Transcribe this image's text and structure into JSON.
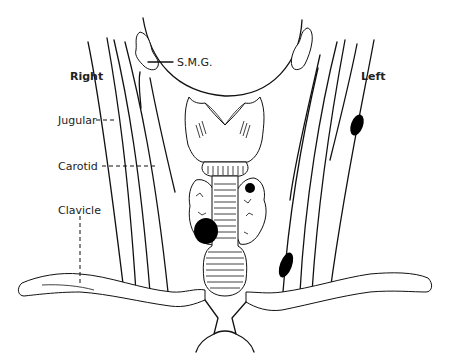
{
  "diagram": {
    "side_labels": {
      "right": "Right",
      "left": "Left"
    },
    "structure_labels": {
      "smg": "S.M.G.",
      "jugular": "Jugular",
      "carotid": "Carotid",
      "clavicle": "Clavicle"
    },
    "colors": {
      "line": "#111111",
      "mass": "#000000",
      "background": "#ffffff"
    },
    "masses": [
      {
        "name": "left-lateral-upper-mass",
        "side": "left"
      },
      {
        "name": "left-lateral-lower-mass",
        "side": "left"
      },
      {
        "name": "left-thyroid-lobe-mass",
        "side": "left"
      },
      {
        "name": "right-thyroid-lobe-mass",
        "side": "right"
      }
    ]
  }
}
